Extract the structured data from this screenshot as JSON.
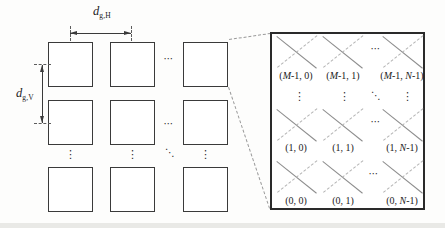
{
  "figure": {
    "grid": {
      "h_spacing_label": {
        "base": "d",
        "sub": "g,H"
      },
      "v_spacing_label": {
        "base": "d",
        "sub": "g,V"
      },
      "col_ellipsis": "⋯",
      "row_ellipsis": "⋮",
      "diag_ellipsis": "⋱"
    },
    "panel": {
      "dots": {
        "vdots": "⋮",
        "ddots": "⋱"
      },
      "rows": [
        {
          "ellipsis": "⋯",
          "labels": [
            "(M-1, 0)",
            "(M-1, 1)",
            "(M-1, N-1)"
          ]
        },
        {
          "ellipsis": "⋯",
          "labels": [
            "(1, 0)",
            "(1, 1)",
            "(1, N-1)"
          ]
        },
        {
          "ellipsis": "⋯",
          "labels": [
            "(0, 0)",
            "(0, 1)",
            "(0, N-1)"
          ]
        }
      ]
    }
  }
}
